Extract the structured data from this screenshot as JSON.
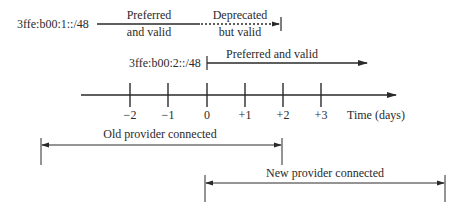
{
  "prefixes": [
    {
      "label": "3ffe:b00:1::/48",
      "segments": [
        {
          "state_line1": "Preferred",
          "state_line2": "and valid",
          "style": "solid"
        },
        {
          "state_line1": "Deprecated",
          "state_line2": "but valid",
          "style": "dotted"
        }
      ]
    },
    {
      "label": "3ffe:b00:2::/48",
      "segments": [
        {
          "state_line1": "Preferred and valid",
          "style": "solid"
        }
      ]
    }
  ],
  "axis": {
    "label": "Time (days)",
    "ticks": [
      "−2",
      "−1",
      "0",
      "+1",
      "+2",
      "+3"
    ]
  },
  "providers": [
    {
      "label": "Old provider connected",
      "from_day": "-4",
      "to_day": "+2"
    },
    {
      "label": "New provider connected",
      "from_day": "0",
      "to_day": "+6"
    }
  ],
  "colors": {
    "line": "#2a2a2a"
  }
}
